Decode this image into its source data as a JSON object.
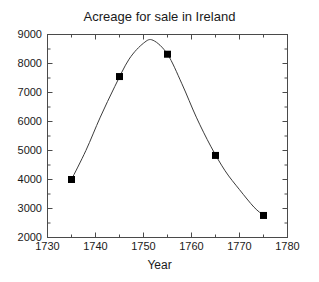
{
  "chart_data": {
    "type": "scatter",
    "title": "Acreage for sale in Ireland",
    "xlabel": "Year",
    "ylabel": "",
    "xlim": [
      1730,
      1780
    ],
    "ylim": [
      2000,
      9000
    ],
    "xticks": [
      1730,
      1740,
      1750,
      1760,
      1770,
      1780
    ],
    "yticks": [
      2000,
      3000,
      4000,
      5000,
      6000,
      7000,
      8000,
      9000
    ],
    "xtick_labels": [
      "1730",
      "1740",
      "1750",
      "1760",
      "1770",
      "1780"
    ],
    "ytick_labels": [
      "2000",
      "3000",
      "4000",
      "5000",
      "6000",
      "7000",
      "8000",
      "9000"
    ],
    "x_minor_tick_step": 5,
    "y_minor_tick_step": 500,
    "grid": false,
    "legend": false,
    "marker": "filled-square",
    "marker_color": "#000000",
    "line_color": "#3c3c3c",
    "x": [
      1735,
      1745,
      1755,
      1765,
      1775
    ],
    "values": [
      4000,
      7550,
      8320,
      4830,
      2760
    ],
    "series": [
      {
        "name": "Acreage for sale",
        "points": [
          {
            "x": 1735,
            "y": 4000
          },
          {
            "x": 1745,
            "y": 7550
          },
          {
            "x": 1755,
            "y": 8320
          },
          {
            "x": 1765,
            "y": 4830
          },
          {
            "x": 1775,
            "y": 2760
          }
        ]
      }
    ],
    "fitted_curve": {
      "description": "smooth fitted curve through the points, peak near 1752",
      "peak_x": 1752,
      "peak_y": 8800,
      "x": [
        1735,
        1738,
        1741,
        1744,
        1747,
        1750,
        1752,
        1755,
        1758,
        1761,
        1764,
        1767,
        1770,
        1773,
        1775
      ],
      "y": [
        4000,
        5000,
        6150,
        7200,
        8150,
        8700,
        8800,
        8320,
        7300,
        6150,
        5150,
        4300,
        3650,
        3050,
        2760
      ]
    }
  },
  "axes": {
    "frame_color": "#4a4a4a",
    "tick_color": "#4a4a4a"
  }
}
